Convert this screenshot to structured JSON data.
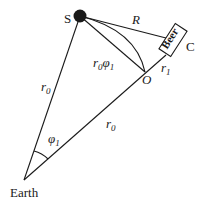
{
  "diagram": {
    "type": "geometry",
    "nodes": {
      "source": {
        "label": "S",
        "x": 80,
        "y": 16
      },
      "earth": {
        "label": "Earth",
        "x": 24,
        "y": 180
      },
      "observer": {
        "label": "O",
        "x": 145,
        "y": 72
      },
      "box": {
        "label": "Beer",
        "corner_label": "C"
      }
    },
    "edges": {
      "s_earth": {
        "label_main": "r",
        "label_sub": "0"
      },
      "earth_o": {
        "label_main": "r",
        "label_sub": "0"
      },
      "o_c": {
        "label_main": "r",
        "label_sub": "1"
      },
      "s_c": {
        "label": "R"
      },
      "arc_s_o": {
        "label_main": "r",
        "label_sub": "0",
        "label_tail": "φ",
        "label_tail_sub": "1"
      }
    },
    "angle": {
      "label_main": "φ",
      "label_sub": "1"
    },
    "colors": {
      "ink": "#1a1a1a",
      "background": "#ffffff"
    }
  }
}
